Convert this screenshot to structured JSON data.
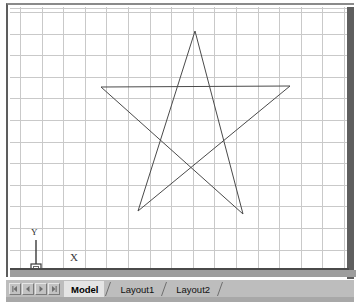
{
  "app": {
    "type": "cad-drawing-viewport"
  },
  "canvas": {
    "grid": {
      "visible": true,
      "spacing_px": 21.6,
      "color": "#c9c9c9"
    },
    "background_color": "#ffffff",
    "geometry_color": "#4a4a4a"
  },
  "ucs_icon": {
    "label_y": "Y",
    "label_x": "X",
    "origin_marker": "square"
  },
  "drawing": {
    "shape_name": "pentagram",
    "stroke_color": "#4a4a4a",
    "stroke_width": 1,
    "points": [
      {
        "name": "apex-top",
        "x": 193,
        "y": 29
      },
      {
        "name": "point-bottom-right",
        "x": 241,
        "y": 212
      },
      {
        "name": "point-left",
        "x": 99,
        "y": 85
      },
      {
        "name": "point-right",
        "x": 288,
        "y": 84
      },
      {
        "name": "point-bottom-left",
        "x": 136,
        "y": 209
      }
    ]
  },
  "tab_bar": {
    "nav_buttons": [
      {
        "name": "first-tab",
        "icon": "first-icon"
      },
      {
        "name": "previous-tab",
        "icon": "previous-icon"
      },
      {
        "name": "next-tab",
        "icon": "next-icon"
      },
      {
        "name": "last-tab",
        "icon": "last-icon"
      }
    ],
    "tabs": [
      {
        "label": "Model",
        "active": true
      },
      {
        "label": "Layout1",
        "active": false
      },
      {
        "label": "Layout2",
        "active": false
      }
    ]
  }
}
